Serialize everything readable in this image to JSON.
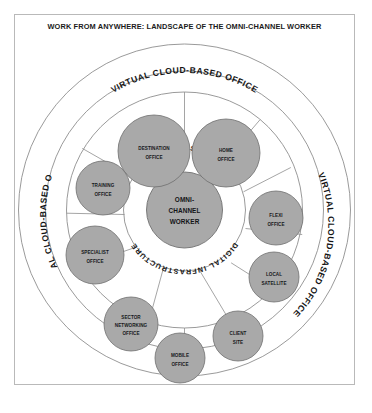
{
  "document": {
    "title": "WORK FROM ANYWHERE: LANDSCAPE OF THE OMNI-CHANNEL WORKER"
  },
  "colors": {
    "bubble_fill": "#a9a9a9",
    "bubble_stroke": "#6f6f6f",
    "ring_stroke": "#8e8e8e",
    "frame_stroke": "#b9b9b9",
    "text": "#141414",
    "background": "#ffffff"
  },
  "diagram": {
    "type": "concentric-hub-and-spoke",
    "center": {
      "line1": "OMNI-",
      "line2": "CHANNEL",
      "line3": "WORKER"
    },
    "inner_ring": {
      "label": "DIGITAL INFRASTRUCTURE",
      "label_top": "DIGITAL INFRASTRUCTURE",
      "label_bottom": "DIGITAL INFRASTRUCTURE"
    },
    "outer_ring": {
      "label": "VIRTUAL CLOUD-BASED OFFICE",
      "label_top": "VIRTUAL CLOUD-BASED OFFICE",
      "label_left": "VIRTUAL CLOUD-BASED OFFICE",
      "label_right": "VIRTUAL CLOUD-BASED OFFICE"
    },
    "nodes": [
      {
        "id": "destination-office",
        "line1": "DESTINATION",
        "line2": "OFFICE"
      },
      {
        "id": "home-office",
        "line1": "HOME",
        "line2": "OFFICE"
      },
      {
        "id": "flexi-office",
        "line1": "FLEXI",
        "line2": "OFFICE"
      },
      {
        "id": "local-satellite",
        "line1": "LOCAL",
        "line2": "SATELLITE"
      },
      {
        "id": "client-site",
        "line1": "CLIENT",
        "line2": "SITE"
      },
      {
        "id": "mobile-office",
        "line1": "MOBILE",
        "line2": "OFFICE"
      },
      {
        "id": "sector-networking-office",
        "line1": "SECTOR",
        "line2": "NETWORKING",
        "line3": "OFFICE"
      },
      {
        "id": "specialist-office",
        "line1": "SPECIALIST",
        "line2": "OFFICE"
      },
      {
        "id": "training-office",
        "line1": "TRAINING",
        "line2": "OFFICE"
      }
    ]
  }
}
